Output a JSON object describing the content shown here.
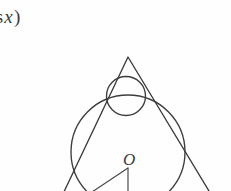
{
  "page": {
    "width": 231,
    "height": 191,
    "background_color": "#fefefe",
    "ink_color": "#3c3c3e"
  },
  "formula_fragment": {
    "prefix_text": "os",
    "variable": "x",
    "suffix_text": ")",
    "full_visible_text": "os x)"
  },
  "figure": {
    "name": "triangle-with-inscribed-circles",
    "center_label": "O",
    "elements": [
      "triangle",
      "large-inscribed-circle",
      "small-apex-circle",
      "radius-segment-vertical",
      "radius-segment-diagonal"
    ],
    "triangle": {
      "apex": [
        128,
        57
      ],
      "bottom_left": [
        62,
        196
      ],
      "bottom_right": [
        212,
        196
      ]
    },
    "large_circle": {
      "center": [
        128,
        152
      ],
      "radius": 57
    },
    "small_circle": {
      "center": [
        126,
        96
      ],
      "radius": 19.5
    },
    "radius_vertical": {
      "from": [
        128,
        168
      ],
      "to": [
        128,
        196
      ]
    },
    "radius_diagonal": {
      "from": [
        128,
        168
      ],
      "to": [
        86,
        196
      ]
    }
  }
}
